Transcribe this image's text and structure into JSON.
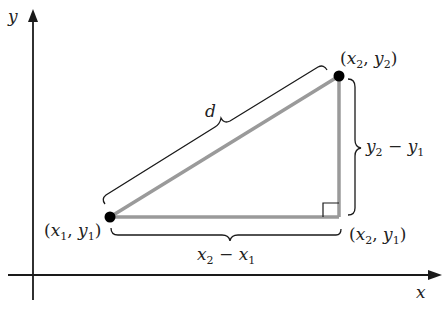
{
  "diagram": {
    "axes": {
      "x_label": "x",
      "y_label": "y"
    },
    "points": {
      "p1": {
        "var_x": "x",
        "sub_x": "1",
        "var_y": "y",
        "sub_y": "1"
      },
      "p2": {
        "var_x": "x",
        "sub_x": "2",
        "var_y": "y",
        "sub_y": "2"
      },
      "p3": {
        "var_x": "x",
        "sub_x": "2",
        "var_y": "y",
        "sub_y": "1"
      }
    },
    "labels": {
      "hypotenuse": "d",
      "horizontal": {
        "a": "x",
        "a_sub": "2",
        "op": " − ",
        "b": "x",
        "b_sub": "1"
      },
      "vertical": {
        "a": "y",
        "a_sub": "2",
        "op": " − ",
        "b": "y",
        "b_sub": "1"
      }
    },
    "colors": {
      "axis": "#1a1a1a",
      "triangle": "#9a9a9a",
      "point": "#000000",
      "text": "#222222"
    }
  }
}
